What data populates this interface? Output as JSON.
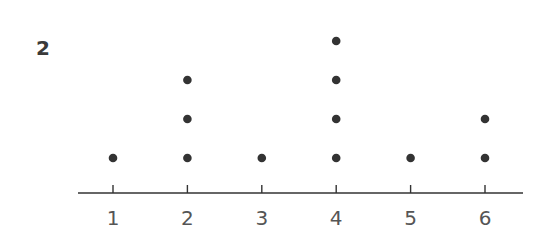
{
  "problem": {
    "number": "2"
  },
  "colors": {
    "dot": "#333333",
    "axis": "#333333",
    "label": "#555555"
  },
  "chart_data": {
    "type": "scatter",
    "subtype": "dot_plot",
    "title": "",
    "xlabel": "",
    "ylabel": "",
    "categories": [
      "1",
      "2",
      "3",
      "4",
      "5",
      "6"
    ],
    "x": [
      1,
      2,
      3,
      4,
      5,
      6
    ],
    "values": [
      1,
      3,
      1,
      4,
      1,
      2
    ],
    "xlim": [
      1,
      6
    ],
    "grid": false,
    "legend": null
  }
}
